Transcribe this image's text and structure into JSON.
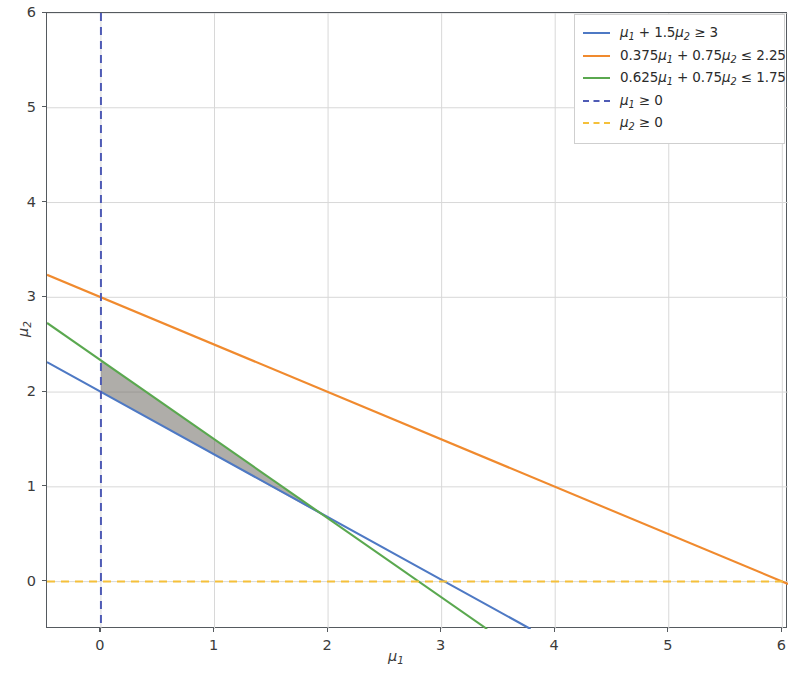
{
  "chart_data": {
    "type": "line",
    "title": "",
    "xlabel": "μ₁",
    "ylabel": "μ₂",
    "xlim": [
      -0.475,
      6.05
    ],
    "ylim": [
      -0.5,
      6.0
    ],
    "xticks": [
      0,
      1,
      2,
      3,
      4,
      5,
      6
    ],
    "yticks": [
      0,
      1,
      2,
      3,
      4,
      5,
      6
    ],
    "xticklabels": [
      "0",
      "1",
      "2",
      "3",
      "4",
      "5",
      "6"
    ],
    "yticklabels": [
      "0",
      "1",
      "2",
      "3",
      "4",
      "5",
      "6"
    ],
    "grid": true,
    "legend_position": "upper right",
    "series": [
      {
        "name": "μ₁ + 1.5μ₂ ≥ 3",
        "label_parts": {
          "coef1": "",
          "var1": "μ₁",
          "op1": "+",
          "coef2": "1.5",
          "var2": "μ₂",
          "relation": "≥",
          "rhs": "3"
        },
        "color": "#4e79c4",
        "linestyle": "solid",
        "equation": "mu1 + 1.5*mu2 = 3",
        "slope": -0.6666666667,
        "intercept": 2.0,
        "endpoints": [
          [
            -0.475,
            2.3167
          ],
          [
            3.7833,
            -0.5
          ]
        ]
      },
      {
        "name": "0.375μ₁ + 0.75μ₂ ≤ 2.25",
        "label_parts": {
          "coef1": "0.375",
          "var1": "μ₁",
          "op1": "+",
          "coef2": "0.75",
          "var2": "μ₂",
          "relation": "≤",
          "rhs": "2.25"
        },
        "color": "#f08a2e",
        "linestyle": "solid",
        "equation": "0.375*mu1 + 0.75*mu2 = 2.25",
        "slope": -0.5,
        "intercept": 3.0,
        "endpoints": [
          [
            -0.475,
            3.2375
          ],
          [
            6.05,
            -0.025
          ]
        ]
      },
      {
        "name": "0.625μ₁ + 0.75μ₂ ≤ 1.75",
        "label_parts": {
          "coef1": "0.625",
          "var1": "μ₁",
          "op1": "+",
          "coef2": "0.75",
          "var2": "μ₂",
          "relation": "≤",
          "rhs": "1.75"
        },
        "color": "#5aa84f",
        "linestyle": "solid",
        "equation": "0.625*mu1 + 0.75*mu2 = 1.75",
        "slope": -0.8333333333,
        "intercept": 2.3333333333,
        "endpoints": [
          [
            -0.475,
            2.7292
          ],
          [
            3.4,
            -0.5
          ]
        ]
      },
      {
        "name": "μ₁ ≥ 0",
        "label_parts": {
          "coef1": "",
          "var1": "μ₁",
          "op1": "",
          "coef2": "",
          "var2": "",
          "relation": "≥",
          "rhs": "0"
        },
        "color": "#4f5bb5",
        "linestyle": "dashed",
        "equation": "mu1 = 0",
        "orientation": "vertical",
        "value": 0
      },
      {
        "name": "μ₂ ≥ 0",
        "label_parts": {
          "coef1": "",
          "var1": "μ₂",
          "op1": "",
          "coef2": "",
          "var2": "",
          "relation": "≥",
          "rhs": "0"
        },
        "color": "#f5c03a",
        "linestyle": "dashed",
        "equation": "mu2 = 0",
        "orientation": "horizontal",
        "value": 0
      }
    ],
    "shaded_region": {
      "name": "feasible-region",
      "fill_color": "#6e6a62",
      "fill_opacity": 0.55,
      "description": "Feasible set bounded left by mu1=0, above by 0.625mu1+0.75mu2=1.75, below by mu1+1.5mu2=3",
      "vertices": [
        [
          0,
          2.0
        ],
        [
          0,
          2.3333
        ],
        [
          2.0,
          0.6667
        ]
      ]
    },
    "annotations": []
  },
  "legend": {
    "entries": [
      "μ₁ + 1.5μ₂ ≥ 3",
      "0.375μ₁ + 0.75μ₂ ≤ 2.25",
      "0.625μ₁ + 0.75μ₂ ≤ 1.75",
      "μ₁ ≥ 0",
      "μ₂ ≥ 0"
    ]
  },
  "style": {
    "background": "#ffffff",
    "axis_color": "#555a5f",
    "grid_color": "#d8d8d8",
    "tick_label_color": "#3b3b3b"
  }
}
